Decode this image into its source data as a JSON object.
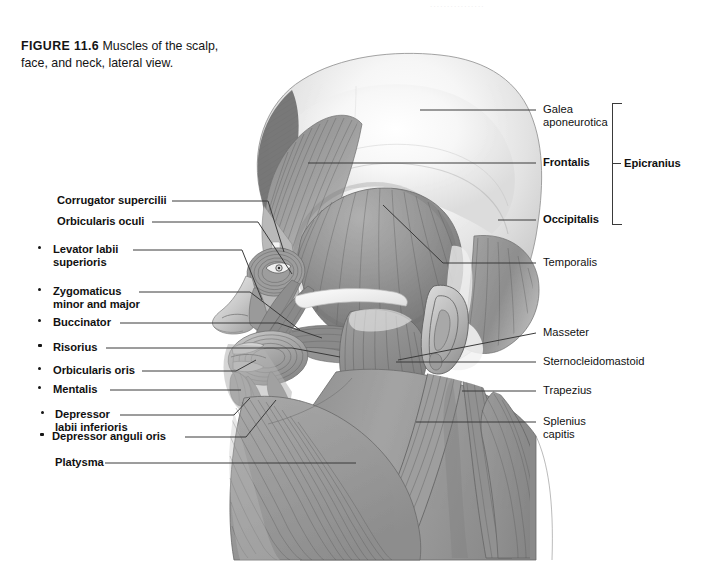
{
  "figure": {
    "number": "FIGURE 11.6",
    "caption": "Muscles of the scalp, face, and neck, lateral view.",
    "ghost_text": "................",
    "background_color": "#ffffff",
    "line_color": "#3a3a3a",
    "text_color": "#111111"
  },
  "labels_left": [
    {
      "text": "Corrugator supercilii",
      "bullet": false,
      "weight": "bold"
    },
    {
      "text": "Orbicularis oculi",
      "bullet": false,
      "weight": "bold"
    },
    {
      "text": "Levator labii",
      "text2": "superioris",
      "bullet": true,
      "weight": "bold"
    },
    {
      "text": "Zygomaticus",
      "text2": "minor and major",
      "bullet": true,
      "weight": "bold"
    },
    {
      "text": "Buccinator",
      "bullet": true,
      "weight": "bold"
    },
    {
      "text": "Risorius",
      "bullet": true,
      "weight": "bold"
    },
    {
      "text": "Orbicularis oris",
      "bullet": true,
      "weight": "bold"
    },
    {
      "text": "Mentalis",
      "bullet": true,
      "weight": "bold"
    },
    {
      "text": "Depressor",
      "text2": "labii inferioris",
      "bullet": true,
      "weight": "bold"
    },
    {
      "text": "Depressor anguli oris",
      "bullet": true,
      "weight": "bold"
    },
    {
      "text": "Platysma",
      "bullet": false,
      "weight": "bold"
    }
  ],
  "labels_right": [
    {
      "text": "Galea",
      "text2": "aponeurotica",
      "weight": "normal"
    },
    {
      "text": "Frontalis",
      "weight": "bold"
    },
    {
      "text": "Occipitalis",
      "weight": "bold"
    },
    {
      "text": "Temporalis",
      "weight": "normal"
    },
    {
      "text": "Masseter",
      "weight": "normal"
    },
    {
      "text": "Sternocleidomastoid",
      "weight": "normal"
    },
    {
      "text": "Trapezius",
      "weight": "normal"
    },
    {
      "text": "Splenius",
      "text2": "capitis",
      "weight": "normal"
    }
  ],
  "group_bracket": {
    "label": "Epicranius",
    "members": [
      "Galea aponeurotica",
      "Frontalis",
      "Occipitalis"
    ]
  },
  "illustration": {
    "alt": "Grayscale lateral-view anatomical drawing of the human head and neck showing superficial muscles of the scalp, face, and neck"
  }
}
